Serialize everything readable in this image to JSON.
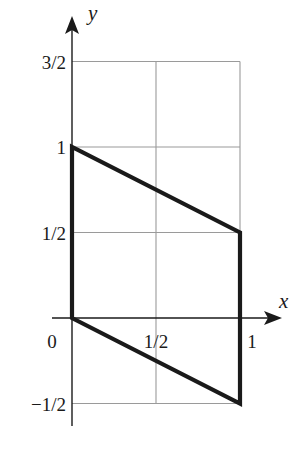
{
  "chart_data": {
    "type": "line",
    "title": "",
    "xlabel": "x",
    "ylabel": "y",
    "xlim": [
      -0.08,
      1.2
    ],
    "ylim": [
      -0.52,
      1.72
    ],
    "grid": true,
    "grid_lines": {
      "x": [
        0.5,
        1
      ],
      "y": [
        -0.5,
        0.5,
        1,
        1.5
      ]
    },
    "x_ticks": [
      {
        "value": 0,
        "label": "0"
      },
      {
        "value": 0.5,
        "label": "1/2"
      },
      {
        "value": 1,
        "label": "1"
      }
    ],
    "y_ticks": [
      {
        "value": -0.5,
        "label": "−1/2"
      },
      {
        "value": 0.5,
        "label": "1/2"
      },
      {
        "value": 1,
        "label": "1"
      },
      {
        "value": 1.5,
        "label": "3/2"
      }
    ],
    "series": [
      {
        "name": "region boundary (parallelogram)",
        "closed": true,
        "points": [
          [
            0,
            0
          ],
          [
            0,
            1
          ],
          [
            1,
            0.5
          ],
          [
            1,
            -0.5
          ]
        ]
      }
    ],
    "colors": {
      "shape": "#1a1a1a",
      "axis": "#1a1a1a",
      "grid": "#9a9a9a"
    }
  }
}
